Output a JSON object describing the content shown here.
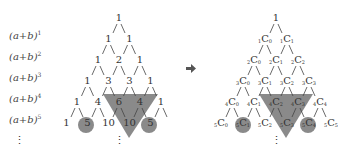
{
  "labels": [
    {
      "base": "(a+b)",
      "exp": "1"
    },
    {
      "base": "(a+b)",
      "exp": "2"
    },
    {
      "base": "(a+b)",
      "exp": "3"
    },
    {
      "base": "(a+b)",
      "exp": "4"
    },
    {
      "base": "(a+b)",
      "exp": "5"
    }
  ],
  "left_rows": [
    [
      "1"
    ],
    [
      "1",
      "1"
    ],
    [
      "1",
      "2",
      "1"
    ],
    [
      "1",
      "3",
      "3",
      "1"
    ],
    [
      "1",
      "4",
      "6",
      "4",
      "1"
    ],
    [
      "1",
      "5",
      "10",
      "10",
      "5"
    ]
  ],
  "right_rows": [
    [
      {
        "t": "1"
      }
    ],
    [
      {
        "n": "1",
        "k": "0"
      },
      {
        "n": "1",
        "k": "1"
      }
    ],
    [
      {
        "n": "2",
        "k": "0"
      },
      {
        "n": "2",
        "k": "1"
      },
      {
        "n": "2",
        "k": "2"
      }
    ],
    [
      {
        "n": "3",
        "k": "0"
      },
      {
        "n": "3",
        "k": "1"
      },
      {
        "n": "3",
        "k": "2"
      },
      {
        "n": "3",
        "k": "3"
      }
    ],
    [
      {
        "n": "4",
        "k": "0"
      },
      {
        "n": "4",
        "k": "1"
      },
      {
        "n": "4",
        "k": "2"
      },
      {
        "n": "4",
        "k": "3"
      },
      {
        "n": "4",
        "k": "4"
      }
    ],
    [
      {
        "n": "5",
        "k": "0"
      },
      {
        "n": "5",
        "k": "1"
      },
      {
        "n": "5",
        "k": "2"
      },
      {
        "n": "5",
        "k": "3"
      },
      {
        "n": "5",
        "k": "4"
      },
      {
        "n": "5",
        "k": "5"
      }
    ]
  ],
  "ellipsis": "⋮",
  "arrow": "➡",
  "colors": {
    "highlight": "#8a8a8a",
    "text": "#333333"
  }
}
